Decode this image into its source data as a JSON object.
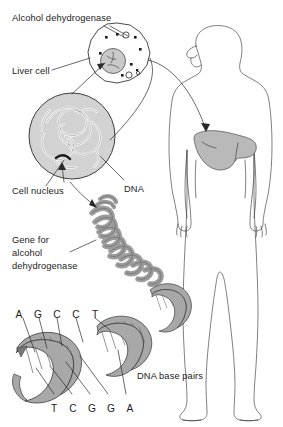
{
  "figure": {
    "background_color": "#ffffff",
    "ink_color": "#2a2a2a"
  },
  "labels": {
    "alcohol_dehydrogenase": "Alcohol dehydrogenase",
    "liver_cell": "Liver cell",
    "cell_nucleus": "Cell nucleus",
    "dna": "DNA",
    "gene_line_1": "Gene for",
    "gene_line_2": "alcohol",
    "gene_line_3": "dehydrogenase",
    "dna_base_pairs": "DNA base pairs"
  },
  "bases": {
    "top_strand": [
      "A",
      "G",
      "C",
      "C",
      "T"
    ],
    "bottom_strand": [
      "T",
      "C",
      "G",
      "G",
      "A"
    ]
  },
  "colors": {
    "nucleus_fill": "#c9c9c9",
    "liver_fill": "#b9b9b9",
    "chromatin_fill": "#9c9c9c",
    "helix_ribbon_fill": "#a8a8a8",
    "enzyme_dot": "#1b1b1b",
    "outline": "#2a2a2a"
  },
  "parts": {
    "liver_cell_shape": "liver-cell",
    "nucleus_shape": "cell-nucleus",
    "chromatin_coil_shape": "chromatin-coil",
    "double_helix_shape": "dna-double-helix",
    "human_body_shape": "human-body-outline",
    "liver_organ_shape": "liver-organ"
  }
}
